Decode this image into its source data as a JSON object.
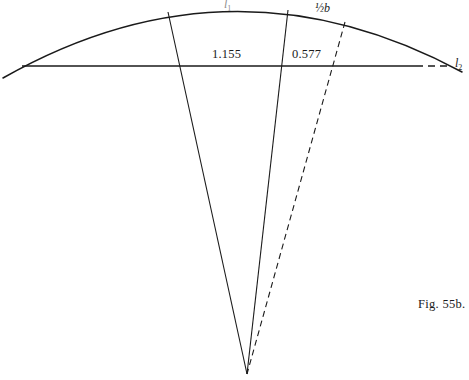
{
  "figure": {
    "caption": "Fig. 55b.",
    "caption_x": 418,
    "caption_y": 297,
    "width": 469,
    "height": 380,
    "background": "#ffffff",
    "stroke_color": "#1a1a1a"
  },
  "labels": {
    "arc_top": "l",
    "arc_top_sub": "1",
    "half_base": "½b",
    "baseline_right": "l",
    "baseline_right_sub": "2",
    "dim_left": "1.155",
    "dim_right": "0.577"
  },
  "label_positions": {
    "arc_top": {
      "x": 224,
      "y": 0
    },
    "half_base": {
      "x": 315,
      "y": 2
    },
    "baseline_right": {
      "x": 455,
      "y": 57
    },
    "dim_left": {
      "x": 212,
      "y": 48
    },
    "dim_right": {
      "x": 292,
      "y": 48
    }
  },
  "geometry": {
    "apex": {
      "x": 247,
      "y": 374
    },
    "arc": {
      "start": {
        "x": 3,
        "y": 78
      },
      "end": {
        "x": 462,
        "y": 72
      },
      "control": {
        "x": 232,
        "y": -52
      },
      "peak": {
        "x": 230,
        "y": 7
      }
    },
    "baseline_solid": {
      "x1": 22,
      "y1": 66,
      "x2": 416,
      "y2": 66
    },
    "baseline_dashed": {
      "x1": 416,
      "y1": 66,
      "x2": 449,
      "y2": 66
    },
    "radials": [
      {
        "name": "radial-left",
        "top_x": 168,
        "top_y": 12,
        "crosses_baseline_x": 181
      },
      {
        "name": "radial-middle",
        "top_x": 288,
        "top_y": 10,
        "crosses_baseline_x": 277
      }
    ],
    "dashed_radial": {
      "name": "radial-dashed",
      "top_x": 345,
      "top_y": 22,
      "crosses_baseline_x": 337
    }
  },
  "style": {
    "arc_stroke_width": 1.5,
    "baseline_stroke_width": 1.3,
    "radial_stroke_width": 1.1,
    "dash_pattern_line": "7,5",
    "dash_pattern_radial": "6,4"
  }
}
